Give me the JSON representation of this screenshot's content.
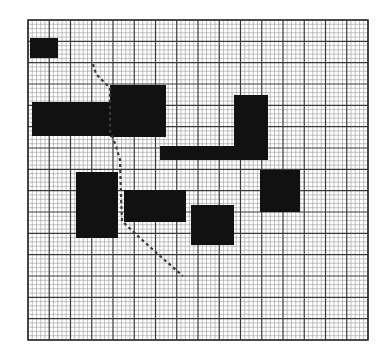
{
  "figure": {
    "title": "Grid occupancy map with planned path",
    "type": "grid-map",
    "canvas": {
      "width": 388,
      "height": 352
    },
    "background_color": "#fefefe"
  },
  "grid": {
    "name": "occupancy-grid",
    "origin_x": 28,
    "origin_y": 20,
    "width": 340,
    "height": 320,
    "minor_cell_size": 4.25,
    "major_every": 5,
    "minor_color": "#9a9a9a",
    "major_color": "#3a3a3a",
    "border_color": "#2a2a2a",
    "minor_line_width": 0.6,
    "major_line_width": 1.2,
    "border_line_width": 1.4,
    "columns": 80,
    "rows": 75
  },
  "obstacles": {
    "color": "#111111",
    "count": 9,
    "items": [
      {
        "id": "obstacle-1",
        "label": "top-left-block",
        "x": 30,
        "y": 38,
        "w": 28,
        "h": 20
      },
      {
        "id": "obstacle-2",
        "label": "left-wide-block",
        "x": 32,
        "y": 102,
        "w": 78,
        "h": 34
      },
      {
        "id": "obstacle-3",
        "label": "center-large-block",
        "x": 110,
        "y": 85,
        "w": 56,
        "h": 52
      },
      {
        "id": "obstacle-4",
        "label": "right-tall-block",
        "x": 234,
        "y": 95,
        "w": 34,
        "h": 65
      },
      {
        "id": "obstacle-5",
        "label": "mid-horizontal-bar",
        "x": 160,
        "y": 146,
        "w": 108,
        "h": 14
      },
      {
        "id": "obstacle-6",
        "label": "lower-left-block",
        "x": 76,
        "y": 172,
        "w": 42,
        "h": 66
      },
      {
        "id": "obstacle-7",
        "label": "lower-mid-block",
        "x": 124,
        "y": 190,
        "w": 62,
        "h": 32
      },
      {
        "id": "obstacle-8",
        "label": "bottom-center-block",
        "x": 191,
        "y": 205,
        "w": 43,
        "h": 40
      },
      {
        "id": "obstacle-9",
        "label": "right-lower-block",
        "x": 260,
        "y": 170,
        "w": 40,
        "h": 42
      }
    ]
  },
  "path": {
    "name": "planned-path",
    "style": "dashed",
    "color": "#3b3b3b",
    "line_width": 2.2,
    "dash_pattern": [
      3,
      3
    ],
    "start_point": {
      "x": 93,
      "y": 64
    },
    "end_point": {
      "x": 183,
      "y": 276
    },
    "waypoints": [
      {
        "x": 93,
        "y": 64
      },
      {
        "x": 96,
        "y": 74
      },
      {
        "x": 104,
        "y": 82
      },
      {
        "x": 110,
        "y": 88
      },
      {
        "x": 110,
        "y": 131
      },
      {
        "x": 116,
        "y": 146
      },
      {
        "x": 120,
        "y": 160
      },
      {
        "x": 121,
        "y": 196
      },
      {
        "x": 122,
        "y": 221
      },
      {
        "x": 140,
        "y": 238
      },
      {
        "x": 160,
        "y": 256
      },
      {
        "x": 183,
        "y": 276
      }
    ]
  }
}
